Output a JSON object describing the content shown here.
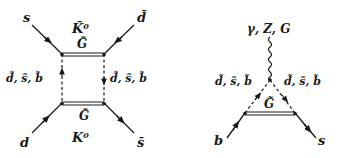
{
  "diagrams": [
    {
      "name": "box-diagram-kaon-mixing",
      "labels": {
        "top_left_quark": "s",
        "top_right_quark": "d̄",
        "bottom_left_quark": "d",
        "bottom_right_quark": "s̄",
        "top_meson": "K̄⁰",
        "bottom_meson": "K⁰",
        "top_gluino": "G̃",
        "bottom_gluino": "G̃",
        "left_squarks": "d̃, s̃, b̃",
        "right_squarks": "d̃, s̃, b̃"
      }
    },
    {
      "name": "penguin-diagram-b-to-s",
      "labels": {
        "boson": "γ, Z, G",
        "left_squarks": "d̃, s̃, b̃",
        "right_squarks": "d̃, s̃, b̃",
        "gluino": "G̃",
        "incoming_quark": "b",
        "outgoing_quark": "s"
      }
    }
  ],
  "colors": {
    "line": "#1a1a1a",
    "background": "#ffffff"
  }
}
